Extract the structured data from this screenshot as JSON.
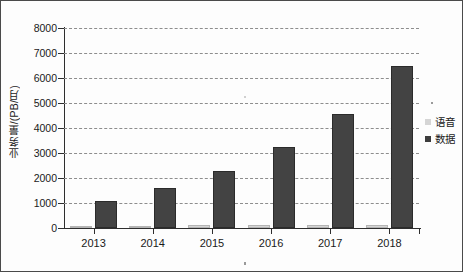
{
  "chart_data": {
    "type": "bar",
    "title": "",
    "subtitle": "",
    "xlabel": "",
    "ylabel": "业务量/(PB/月)",
    "categories": [
      "2013",
      "2014",
      "2015",
      "2016",
      "2017",
      "2018"
    ],
    "series": [
      {
        "name": "语音",
        "color": "#d5d5d5",
        "values": [
          100,
          100,
          110,
          110,
          110,
          120
        ]
      },
      {
        "name": "数据",
        "color": "#434343",
        "values": [
          1100,
          1600,
          2300,
          3250,
          4570,
          6500
        ]
      }
    ],
    "ylim": [
      0,
      8000
    ],
    "yticks": [
      0,
      1000,
      2000,
      3000,
      4000,
      5000,
      6000,
      7000,
      8000
    ],
    "ytick_labels": [
      "0",
      "1000",
      "2000",
      "3000",
      "4000",
      "5000",
      "6000",
      "7000",
      "8000"
    ],
    "grid": true,
    "grid_style": "dashed",
    "grid_color": "#8d8d8d",
    "legend_position": "right",
    "border": true,
    "border_color": "#4a4a4a",
    "background": "#fdfdfd"
  },
  "legend": {
    "entries": [
      {
        "label": "语音",
        "swatch": "voice"
      },
      {
        "label": "数据",
        "swatch": "data"
      }
    ]
  }
}
